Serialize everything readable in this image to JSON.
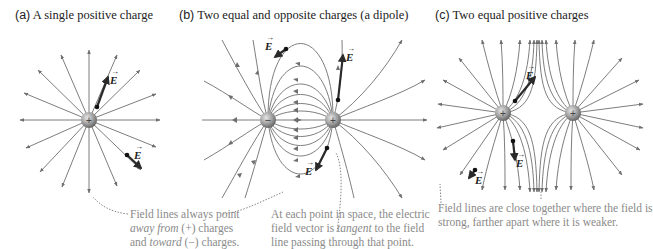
{
  "panels": [
    {
      "id": "a",
      "letter": "(a)",
      "title": "A single positive charge",
      "charges": [
        {
          "sign": "+",
          "x": 89,
          "y": 120
        }
      ],
      "field_vectors": [
        {
          "label": "E"
        },
        {
          "label": "E"
        }
      ]
    },
    {
      "id": "b",
      "letter": "(b)",
      "title": "Two equal and opposite charges (a dipole)",
      "charges": [
        {
          "sign": "−",
          "x": 268,
          "y": 120
        },
        {
          "sign": "+",
          "x": 333,
          "y": 120
        }
      ],
      "field_vectors": [
        {
          "label": "E"
        },
        {
          "label": "E"
        },
        {
          "label": "E"
        }
      ]
    },
    {
      "id": "c",
      "letter": "(c)",
      "title": "Two equal positive charges",
      "charges": [
        {
          "sign": "+",
          "x": 503,
          "y": 113
        },
        {
          "sign": "+",
          "x": 573,
          "y": 113
        }
      ],
      "field_vectors": [
        {
          "label": "E"
        },
        {
          "label": "E"
        },
        {
          "label": "E"
        }
      ]
    }
  ],
  "notes": {
    "field_lines_direction": {
      "line1": "Field lines always point",
      "line2_em": "away from",
      "line2_rest": " (+) charges",
      "line3_pre": "and ",
      "line3_em": "toward",
      "line3_rest": " (−) charges."
    },
    "tangent": {
      "line1": "At each point in space, the electric",
      "line2_pre": "field vector is ",
      "line2_em": "tangent",
      "line2_rest": " to the field",
      "line3": "line passing through that point."
    },
    "density": {
      "line1": "Field lines are close together where the field is",
      "line2": "strong, farther apart where it is weaker."
    }
  },
  "colors": {
    "field_line": "#6e6e6e",
    "vector": "#2a2a2a",
    "charge_light": "#d8d8d8",
    "charge_dark": "#6f6f6f",
    "note_text": "#8a8a8a"
  }
}
